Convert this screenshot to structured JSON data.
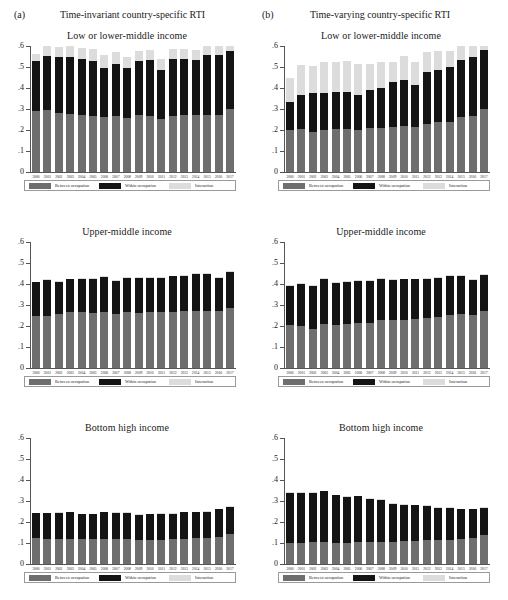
{
  "panels": {
    "a": {
      "letter": "(a)",
      "title": "Time-invariant country-specific RTI"
    },
    "b": {
      "letter": "(b)",
      "title": "Time-varying country-specific RTI"
    }
  },
  "legend": {
    "between": "Between occupation",
    "within": "Within occupation",
    "interaction": "Interaction"
  },
  "colors": {
    "between": "#6e6e6e",
    "within": "#141414",
    "interaction": "#dcdcdc",
    "axis": "#555555"
  },
  "axis": {
    "ylim": [
      0,
      0.6
    ],
    "yticks": [
      0,
      0.1,
      0.2,
      0.3,
      0.4,
      0.5,
      0.6
    ],
    "yticklabels": [
      "0",
      ".1",
      ".2",
      ".3",
      ".4",
      ".5",
      ".6"
    ],
    "years": [
      "2000",
      "2001",
      "2002",
      "2003",
      "2004",
      "2005",
      "2006",
      "2007",
      "2008",
      "2009",
      "2010",
      "2011",
      "2012",
      "2013",
      "2014",
      "2015",
      "2016",
      "2017"
    ]
  },
  "chart_data": [
    {
      "type": "bar",
      "panel": "(a)",
      "panel_title": "Time-invariant country-specific RTI",
      "title": "Low or lower-middle income",
      "stacked": true,
      "xlabel": "",
      "ylabel": "",
      "ylim": [
        0,
        0.6
      ],
      "grid": false,
      "legend_position": "below",
      "categories": [
        "2000",
        "2001",
        "2002",
        "2003",
        "2004",
        "2005",
        "2006",
        "2007",
        "2008",
        "2009",
        "2010",
        "2011",
        "2012",
        "2013",
        "2014",
        "2015",
        "2016",
        "2017"
      ],
      "series": [
        {
          "name": "Between occupation",
          "values": [
            0.29,
            0.298,
            0.282,
            0.278,
            0.272,
            0.268,
            0.262,
            0.268,
            0.258,
            0.272,
            0.268,
            0.252,
            0.268,
            0.272,
            0.272,
            0.278,
            0.282,
            0.318
          ]
        },
        {
          "name": "Within occupation",
          "values": [
            0.24,
            0.256,
            0.266,
            0.272,
            0.268,
            0.262,
            0.232,
            0.246,
            0.238,
            0.256,
            0.266,
            0.236,
            0.27,
            0.268,
            0.262,
            0.29,
            0.29,
            0.296
          ]
        },
        {
          "name": "Interaction",
          "values": [
            0.032,
            0.05,
            0.048,
            0.05,
            0.052,
            0.054,
            0.062,
            0.058,
            0.05,
            0.046,
            0.048,
            0.05,
            0.048,
            0.046,
            0.048,
            0.046,
            0.046,
            0.024
          ]
        }
      ]
    },
    {
      "type": "bar",
      "panel": "(b)",
      "panel_title": "Time-varying country-specific RTI",
      "title": "Low or lower-middle income",
      "stacked": true,
      "xlabel": "",
      "ylabel": "",
      "ylim": [
        0,
        0.6
      ],
      "grid": false,
      "legend_position": "below",
      "categories": [
        "2000",
        "2001",
        "2002",
        "2003",
        "2004",
        "2005",
        "2006",
        "2007",
        "2008",
        "2009",
        "2010",
        "2011",
        "2012",
        "2013",
        "2014",
        "2015",
        "2016",
        "2017"
      ],
      "series": [
        {
          "name": "Between occupation",
          "values": [
            0.2,
            0.206,
            0.192,
            0.2,
            0.204,
            0.206,
            0.2,
            0.208,
            0.21,
            0.214,
            0.22,
            0.212,
            0.23,
            0.238,
            0.24,
            0.266,
            0.274,
            0.318
          ]
        },
        {
          "name": "Within occupation",
          "values": [
            0.134,
            0.16,
            0.186,
            0.178,
            0.178,
            0.176,
            0.166,
            0.184,
            0.19,
            0.216,
            0.22,
            0.204,
            0.248,
            0.248,
            0.26,
            0.278,
            0.286,
            0.294
          ]
        },
        {
          "name": "Interaction",
          "values": [
            0.114,
            0.146,
            0.126,
            0.148,
            0.144,
            0.146,
            0.148,
            0.122,
            0.122,
            0.096,
            0.114,
            0.11,
            0.092,
            0.09,
            0.078,
            0.068,
            0.052,
            0.022
          ]
        }
      ]
    },
    {
      "type": "bar",
      "panel": "(a)",
      "panel_title": "Time-invariant country-specific RTI",
      "title": "Upper-middle income",
      "stacked": true,
      "xlabel": "",
      "ylabel": "",
      "ylim": [
        0,
        0.6
      ],
      "grid": false,
      "legend_position": "below",
      "categories": [
        "2000",
        "2001",
        "2002",
        "2003",
        "2004",
        "2005",
        "2006",
        "2007",
        "2008",
        "2009",
        "2010",
        "2011",
        "2012",
        "2013",
        "2014",
        "2015",
        "2016",
        "2017"
      ],
      "series": [
        {
          "name": "Between occupation",
          "values": [
            0.25,
            0.248,
            0.256,
            0.266,
            0.266,
            0.264,
            0.266,
            0.258,
            0.266,
            0.264,
            0.268,
            0.268,
            0.268,
            0.27,
            0.272,
            0.272,
            0.272,
            0.288
          ]
        },
        {
          "name": "Within occupation",
          "values": [
            0.158,
            0.17,
            0.154,
            0.156,
            0.158,
            0.162,
            0.166,
            0.158,
            0.162,
            0.164,
            0.162,
            0.162,
            0.168,
            0.168,
            0.178,
            0.178,
            0.158,
            0.168
          ]
        },
        {
          "name": "Interaction",
          "values": [
            0.004,
            0.004,
            0.004,
            0.004,
            0.004,
            0.004,
            0.004,
            0.004,
            0.004,
            0.004,
            0.004,
            0.004,
            0.004,
            0.004,
            0.004,
            0.004,
            0.004,
            0.004
          ]
        }
      ]
    },
    {
      "type": "bar",
      "panel": "(b)",
      "panel_title": "Time-varying country-specific RTI",
      "title": "Upper-middle income",
      "stacked": true,
      "xlabel": "",
      "ylabel": "",
      "ylim": [
        0,
        0.6
      ],
      "grid": false,
      "legend_position": "below",
      "categories": [
        "2000",
        "2001",
        "2002",
        "2003",
        "2004",
        "2005",
        "2006",
        "2007",
        "2008",
        "2009",
        "2010",
        "2011",
        "2012",
        "2013",
        "2014",
        "2015",
        "2016",
        "2017"
      ],
      "series": [
        {
          "name": "Between occupation",
          "values": [
            0.206,
            0.2,
            0.188,
            0.208,
            0.204,
            0.21,
            0.216,
            0.216,
            0.228,
            0.228,
            0.23,
            0.232,
            0.238,
            0.242,
            0.252,
            0.256,
            0.254,
            0.272
          ]
        },
        {
          "name": "Within occupation",
          "values": [
            0.184,
            0.2,
            0.202,
            0.216,
            0.202,
            0.202,
            0.198,
            0.198,
            0.198,
            0.192,
            0.192,
            0.19,
            0.186,
            0.186,
            0.184,
            0.18,
            0.166,
            0.172
          ]
        },
        {
          "name": "Interaction",
          "values": [
            0.004,
            0.004,
            0.004,
            0.004,
            0.004,
            0.004,
            0.004,
            0.004,
            0.004,
            0.004,
            0.004,
            0.004,
            0.004,
            0.006,
            0.006,
            0.008,
            0.006,
            0.004
          ]
        }
      ]
    },
    {
      "type": "bar",
      "panel": "(a)",
      "panel_title": "Time-invariant country-specific RTI",
      "title": "Bottom high income",
      "stacked": true,
      "xlabel": "",
      "ylabel": "",
      "ylim": [
        0,
        0.6
      ],
      "grid": false,
      "legend_position": "below",
      "categories": [
        "2000",
        "2001",
        "2002",
        "2003",
        "2004",
        "2005",
        "2006",
        "2007",
        "2008",
        "2009",
        "2010",
        "2011",
        "2012",
        "2013",
        "2014",
        "2015",
        "2016",
        "2017"
      ],
      "series": [
        {
          "name": "Between occupation",
          "values": [
            0.122,
            0.12,
            0.12,
            0.12,
            0.118,
            0.118,
            0.12,
            0.118,
            0.118,
            0.114,
            0.114,
            0.116,
            0.118,
            0.12,
            0.122,
            0.124,
            0.128,
            0.142
          ]
        },
        {
          "name": "Within occupation",
          "values": [
            0.12,
            0.122,
            0.124,
            0.128,
            0.12,
            0.12,
            0.126,
            0.126,
            0.126,
            0.12,
            0.124,
            0.124,
            0.122,
            0.126,
            0.126,
            0.126,
            0.132,
            0.13
          ]
        },
        {
          "name": "Interaction",
          "values": [
            0.002,
            0.002,
            0.002,
            0.002,
            0.002,
            0.002,
            0.002,
            0.002,
            0.002,
            0.002,
            0.002,
            0.002,
            0.002,
            0.002,
            0.002,
            0.002,
            0.002,
            0.002
          ]
        }
      ]
    },
    {
      "type": "bar",
      "panel": "(b)",
      "panel_title": "Time-varying country-specific RTI",
      "title": "Bottom high income",
      "stacked": true,
      "xlabel": "",
      "ylabel": "",
      "ylim": [
        0,
        0.6
      ],
      "grid": false,
      "legend_position": "below",
      "categories": [
        "2000",
        "2001",
        "2002",
        "2003",
        "2004",
        "2005",
        "2006",
        "2007",
        "2008",
        "2009",
        "2010",
        "2011",
        "2012",
        "2013",
        "2014",
        "2015",
        "2016",
        "2017"
      ],
      "series": [
        {
          "name": "Between occupation",
          "values": [
            0.102,
            0.102,
            0.104,
            0.104,
            0.102,
            0.102,
            0.104,
            0.104,
            0.104,
            0.106,
            0.108,
            0.11,
            0.112,
            0.114,
            0.116,
            0.12,
            0.124,
            0.14
          ]
        },
        {
          "name": "Within occupation",
          "values": [
            0.238,
            0.238,
            0.236,
            0.244,
            0.226,
            0.218,
            0.218,
            0.208,
            0.202,
            0.182,
            0.174,
            0.17,
            0.166,
            0.154,
            0.152,
            0.142,
            0.136,
            0.128
          ]
        },
        {
          "name": "Interaction",
          "values": [
            0.002,
            0.002,
            0.002,
            0.002,
            0.002,
            0.002,
            0.002,
            0.002,
            0.002,
            0.002,
            0.002,
            0.002,
            0.002,
            0.002,
            0.002,
            0.002,
            0.002,
            0.002
          ]
        }
      ]
    }
  ]
}
